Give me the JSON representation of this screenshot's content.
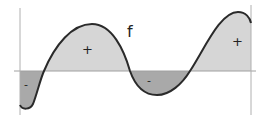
{
  "diagram": {
    "function_label": "f",
    "region_signs": [
      "-",
      "+",
      "-",
      "+"
    ],
    "colors": {
      "positive_fill": "#d6d6d6",
      "negative_fill": "#a9a9a9",
      "curve": "#2a2a2a",
      "axis": "#a0a0a0"
    }
  }
}
